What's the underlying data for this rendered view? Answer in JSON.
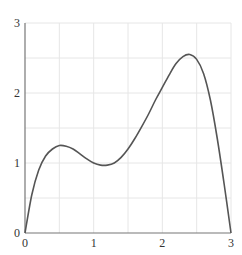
{
  "chart_data": {
    "type": "line",
    "title": "",
    "xlabel": "",
    "ylabel": "",
    "xlim": [
      0,
      3
    ],
    "ylim": [
      0,
      3
    ],
    "grid": true,
    "grid_step": 0.5,
    "x_ticks": [
      "0",
      "1",
      "2",
      "3"
    ],
    "y_ticks": [
      "0",
      "1",
      "2",
      "3"
    ],
    "series": [
      {
        "name": "curve",
        "color": "#555555",
        "x": [
          0,
          0.1,
          0.2,
          0.3,
          0.4,
          0.5,
          0.6,
          0.7,
          0.8,
          0.9,
          1.0,
          1.1,
          1.2,
          1.3,
          1.4,
          1.5,
          1.6,
          1.7,
          1.8,
          1.9,
          2.0,
          2.1,
          2.2,
          2.3,
          2.4,
          2.5,
          2.6,
          2.7,
          2.8,
          2.9,
          3.0
        ],
        "values": [
          0,
          0.55,
          0.9,
          1.1,
          1.2,
          1.25,
          1.24,
          1.2,
          1.13,
          1.06,
          1.0,
          0.97,
          0.97,
          1.0,
          1.08,
          1.2,
          1.35,
          1.52,
          1.7,
          1.9,
          2.08,
          2.26,
          2.42,
          2.52,
          2.55,
          2.48,
          2.28,
          1.9,
          1.35,
          0.7,
          0
        ]
      }
    ]
  },
  "colors": {
    "grid": "#e6e6e6",
    "axis": "#777777",
    "curve": "#555555"
  }
}
